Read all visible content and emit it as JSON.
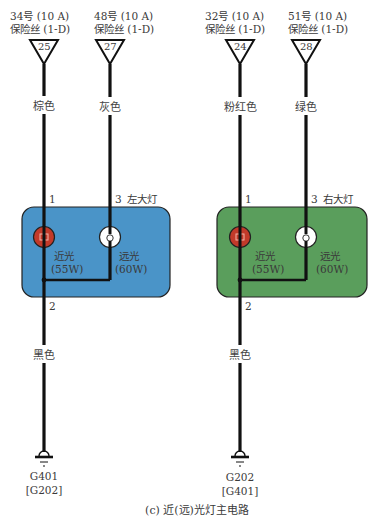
{
  "colors": {
    "wire": "#111111",
    "left_module": "#3f8fc4",
    "right_module": "#4f9a55",
    "low_beam_bulb": "#c0392b",
    "high_beam_bulb": "#ffffff"
  },
  "fuses": [
    {
      "label_top": "34号 (10 A)",
      "label_bottom": "保险丝 (1-D)",
      "number": "25"
    },
    {
      "label_top": "48号 (10 A)",
      "label_bottom": "保险丝 (1-D)",
      "number": "27"
    },
    {
      "label_top": "32号 (10 A)",
      "label_bottom": "保险丝 (1-D)",
      "number": "24"
    },
    {
      "label_top": "51号 (10 A)",
      "label_bottom": "保险丝 (1-D)",
      "number": "28"
    }
  ],
  "wires": {
    "left_low": "棕色",
    "left_high": "灰色",
    "right_low": "粉红色",
    "right_high": "绿色",
    "left_ground": "黑色",
    "right_ground": "黑色"
  },
  "left_headlamp": {
    "name": "左大灯",
    "pin1": "1",
    "pin2": "2",
    "pin3": "3",
    "low_beam": {
      "name": "近光",
      "power": "(55W)"
    },
    "high_beam": {
      "name": "远光",
      "power": "(60W)"
    }
  },
  "right_headlamp": {
    "name": "右大灯",
    "pin1": "1",
    "pin2": "2",
    "pin3": "3",
    "low_beam": {
      "name": "近光",
      "power": "(55W)"
    },
    "high_beam": {
      "name": "远光",
      "power": "(60W)"
    }
  },
  "grounds": [
    {
      "name": "G401",
      "alt": "[G202]"
    },
    {
      "name": "G202",
      "alt": "[G401]"
    }
  ],
  "caption": "(c) 近(远)光灯主电路"
}
